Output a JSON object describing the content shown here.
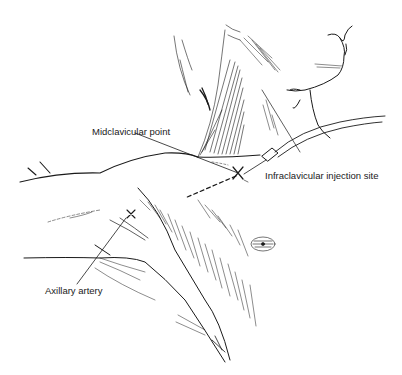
{
  "figure": {
    "type": "anatomical line drawing",
    "labels": {
      "midclavicular_point": "Midclavicular point",
      "infraclavicular_injection_site": "Infraclavicular injection site",
      "axillary_artery": "Axillary artery"
    },
    "markers": [
      {
        "name": "injection-site-x",
        "symbol": "×"
      },
      {
        "name": "axillary-artery-x",
        "symbol": "×"
      }
    ],
    "colors": {
      "line": "#1a1a1a",
      "background": "#ffffff"
    }
  }
}
